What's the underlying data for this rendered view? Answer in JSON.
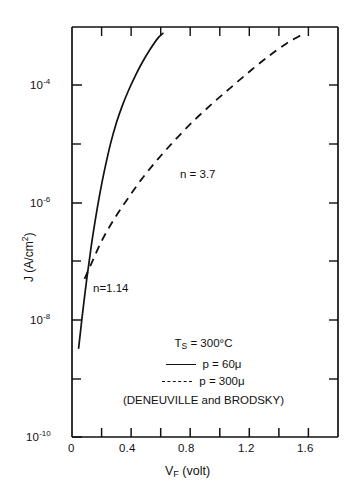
{
  "chart_data": {
    "type": "line",
    "title": "",
    "xlabel": "V_F (volt)",
    "ylabel": "J (A/cm^2)",
    "xlim": [
      0,
      1.8
    ],
    "ylim": [
      1e-10,
      0.001
    ],
    "yscale": "log",
    "grid": false,
    "legend_position": "lower-center-inside",
    "xticks": [
      0,
      0.2,
      0.4,
      0.6,
      0.8,
      1.0,
      1.2,
      1.4,
      1.6,
      1.8
    ],
    "xtick_labels": [
      "0",
      "",
      "0.4",
      "",
      "0.8",
      "",
      "1.2",
      "",
      "1.6",
      ""
    ],
    "ytick_exponents": [
      -4,
      -5,
      -6,
      -7,
      -8,
      -9,
      -10
    ],
    "ytick_labels": [
      "10-4",
      "",
      "10-6",
      "",
      "10-8",
      "",
      "10-10"
    ],
    "series": [
      {
        "name": "p = 60 micron",
        "style": "solid",
        "ideality_factor": "n = 1.14",
        "x": [
          0.045,
          0.07,
          0.1,
          0.13,
          0.16,
          0.19,
          0.22,
          0.26,
          0.3,
          0.34,
          0.38,
          0.43,
          0.48,
          0.53,
          0.58,
          0.615
        ],
        "y": [
          3.3e-09,
          1.2e-08,
          5e-08,
          1.8e-07,
          5.5e-07,
          1.5e-06,
          3.6e-06,
          1e-05,
          2.3e-05,
          4.5e-05,
          8e-05,
          0.00015,
          0.00026,
          0.00042,
          0.00064,
          0.00078
        ]
      },
      {
        "name": "p = 300 micron",
        "style": "dashed",
        "ideality_factor": "n = 3.7",
        "x": [
          0.085,
          0.13,
          0.2,
          0.28,
          0.37,
          0.47,
          0.58,
          0.7,
          0.83,
          0.96,
          1.09,
          1.22,
          1.34,
          1.45,
          1.53,
          1.57
        ],
        "y": [
          5e-08,
          9e-08,
          2.2e-07,
          5e-07,
          1.1e-06,
          2.5e-06,
          5.5e-06,
          1.2e-05,
          2.6e-05,
          5.2e-05,
          0.0001,
          0.00019,
          0.00033,
          0.00052,
          0.00068,
          0.00078
        ]
      }
    ]
  },
  "axes": {
    "y_label_prefix": "J (A/cm",
    "y_label_exponent": "2",
    "y_label_suffix": ")",
    "x_label_prefix": "V",
    "x_label_subscript": "F",
    "x_label_suffix": " (volt)",
    "y_tick_base": "10",
    "y_ticks": [
      {
        "exponent": "-4",
        "value": 0.0001
      },
      {
        "exponent": "-6",
        "value": 1e-06
      },
      {
        "exponent": "-8",
        "value": 1e-08
      },
      {
        "exponent": "-10",
        "value": 1e-10
      }
    ],
    "x_ticks": [
      {
        "label": "0",
        "value": 0
      },
      {
        "label": "0.4",
        "value": 0.4
      },
      {
        "label": "0.8",
        "value": 0.8
      },
      {
        "label": "1.2",
        "value": 1.2
      },
      {
        "label": "1.6",
        "value": 1.6
      }
    ]
  },
  "annotations": {
    "curve_solid_label": "n=1.14",
    "curve_dashed_label": "n = 3.7"
  },
  "legend": {
    "condition_prefix": "T",
    "condition_subscript": "S",
    "condition_value": " = 300°C",
    "entry_solid": "p = 60μ",
    "entry_dashed": "p = 300μ",
    "credit": "(DENEUVILLE and BRODSKY)"
  }
}
